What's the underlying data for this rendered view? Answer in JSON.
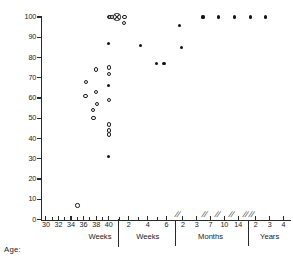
{
  "chart_data": {
    "type": "scatter",
    "title": "",
    "xlabel": "Age:",
    "ylabel": "",
    "ylim": [
      0,
      100
    ],
    "grid": false,
    "legend_position": "none",
    "y_ticks": [
      0,
      10,
      20,
      30,
      40,
      50,
      60,
      70,
      80,
      90,
      100
    ],
    "y_tick_labels": [
      "0",
      "10",
      "20",
      "30",
      "40",
      "50",
      "60",
      "70",
      "80",
      "90",
      "100"
    ],
    "axis_segments": [
      {
        "name": "Weeks",
        "unit": "gestational-weeks",
        "tick_labels": [
          "30",
          "32",
          "34",
          "36",
          "38",
          "40"
        ],
        "tick_values": [
          30,
          32,
          34,
          36,
          38,
          40
        ],
        "minor_ticks": [
          31,
          33,
          35,
          37,
          39
        ],
        "divider_after": "solid"
      },
      {
        "name": "Weeks",
        "unit": "postnatal-weeks",
        "tick_labels": [
          "2",
          "4",
          "6"
        ],
        "tick_values": [
          2,
          4,
          6
        ],
        "minor_ticks": [
          1,
          3,
          5
        ],
        "divider_after": "dotted"
      },
      {
        "name": "Months",
        "unit": "months",
        "tick_labels": [
          "2",
          "3",
          "7",
          "10",
          "14"
        ],
        "tick_values": [
          2,
          3,
          7,
          10,
          14
        ],
        "minor_ticks": [],
        "divider_after": "dotted"
      },
      {
        "name": "Years",
        "unit": "years",
        "tick_labels": [
          "2",
          "3",
          "4"
        ],
        "tick_values": [
          2,
          3,
          4
        ],
        "minor_ticks": [],
        "divider_after": "none"
      }
    ],
    "break_marks": 6,
    "series": [
      {
        "name": "open-circle",
        "marker": "open",
        "points": [
          {
            "x": 35.0,
            "y": 7
          },
          {
            "x": 36.4,
            "y": 68
          },
          {
            "x": 36.3,
            "y": 61
          },
          {
            "x": 38.0,
            "y": 74
          },
          {
            "x": 38.0,
            "y": 63
          },
          {
            "x": 38.1,
            "y": 57
          },
          {
            "x": 37.5,
            "y": 54
          },
          {
            "x": 37.6,
            "y": 50
          },
          {
            "x": 40.0,
            "y": 75
          },
          {
            "x": 40.0,
            "y": 72
          },
          {
            "x": 40.0,
            "y": 59
          },
          {
            "x": 40.0,
            "y": 47
          },
          {
            "x": 40.0,
            "y": 44
          },
          {
            "x": 40.0,
            "y": 42
          },
          {
            "x": 40.0,
            "y": 100
          },
          {
            "x": 40.2,
            "y": 100
          },
          {
            "x": 40.5,
            "y": 100
          },
          {
            "x": 42.5,
            "y": 100
          },
          {
            "x": 42.4,
            "y": 97
          }
        ]
      },
      {
        "name": "filled-circle",
        "marker": "filled",
        "points": [
          {
            "x": 40.0,
            "y": 87
          },
          {
            "x": 40.0,
            "y": 66
          },
          {
            "x": 40.0,
            "y": 31
          },
          {
            "x": 45.0,
            "y": 86
          },
          {
            "x": 47.6,
            "y": 77
          },
          {
            "x": 48.8,
            "y": 77
          },
          {
            "x": 51.2,
            "y": 96
          },
          {
            "x": 51.6,
            "y": 85
          },
          {
            "x": 55.0,
            "y": 100
          },
          {
            "x": 57.5,
            "y": 100
          },
          {
            "x": 60.0,
            "y": 100
          },
          {
            "x": 62.5,
            "y": 100
          },
          {
            "x": 65.0,
            "y": 100
          }
        ]
      },
      {
        "name": "crossed-circle",
        "marker": "crossed",
        "points": [
          {
            "x": 41.3,
            "y": 100
          }
        ]
      }
    ]
  },
  "plot": {
    "y_axis_name": "percent-axis",
    "x_axis_name": "age-axis",
    "age_caption": "Age:"
  }
}
